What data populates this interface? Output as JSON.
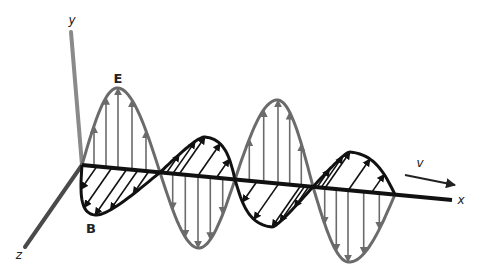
{
  "diagram": {
    "labels": {
      "electric_field": "E",
      "magnetic_field": "B",
      "velocity": "v",
      "axis_x": "x",
      "axis_y": "y",
      "axis_z": "z"
    },
    "colors": {
      "background": "#ffffff",
      "e_wave": "#6b6b6b",
      "b_wave": "#111111",
      "x_axis": "#111111",
      "y_axis": "#8a8a8a",
      "z_axis": "#4a4a4a",
      "label": "#222222"
    },
    "geometry": {
      "origin": [
        82,
        165
      ],
      "y_axis_end": [
        71,
        32
      ],
      "z_axis_end": [
        25,
        247
      ],
      "x_axis_end": [
        452,
        200
      ],
      "nodes_x": [
        82,
        160,
        235,
        313,
        395
      ],
      "e_extrema": [
        [
          118,
          88
        ],
        [
          198,
          248
        ],
        [
          278,
          100
        ],
        [
          348,
          262
        ]
      ],
      "b_extrema": [
        [
          95,
          215
        ],
        [
          205,
          137
        ],
        [
          272,
          227
        ],
        [
          350,
          152
        ]
      ],
      "velocity_arrow": [
        [
          405,
          175
        ],
        [
          455,
          185
        ]
      ]
    }
  }
}
